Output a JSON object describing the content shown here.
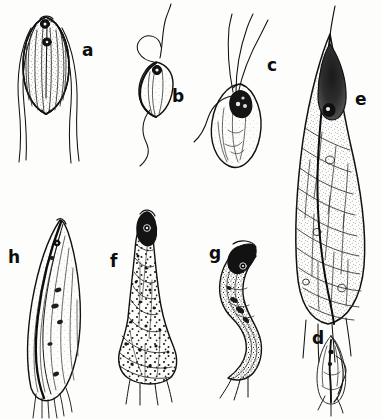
{
  "plate": {
    "width": 382,
    "height": 419,
    "background_color": "#fdfdfc",
    "ink_color": "#111111",
    "description": "Black-and-white scientific line drawing plate of eight flagellate protozoan cells labelled a through h"
  },
  "figure_labels": [
    {
      "id": "a",
      "text": "a",
      "x": 82,
      "y": 42,
      "size": 17
    },
    {
      "id": "b",
      "text": "b",
      "x": 172,
      "y": 88,
      "size": 17
    },
    {
      "id": "c",
      "text": "c",
      "x": 267,
      "y": 57,
      "size": 17
    },
    {
      "id": "e",
      "text": "e",
      "x": 355,
      "y": 91,
      "size": 17
    },
    {
      "id": "h",
      "text": "h",
      "x": 8,
      "y": 249,
      "size": 17
    },
    {
      "id": "f",
      "text": "f",
      "x": 110,
      "y": 253,
      "size": 17
    },
    {
      "id": "g",
      "text": "g",
      "x": 209,
      "y": 245,
      "size": 17
    },
    {
      "id": "d",
      "text": "d",
      "x": 312,
      "y": 330,
      "size": 17
    }
  ],
  "specimens": [
    {
      "id": "a",
      "name": "specimen-a",
      "shape": "broad teardrop / ovoid cell",
      "features": "longitudinal striations, stippled cytoplasm, two dark nuclei near anterior, four long trailing flagella",
      "bbox": [
        18,
        14,
        60,
        105
      ]
    },
    {
      "id": "b",
      "name": "specimen-b",
      "shape": "small heart / leaf shaped cell",
      "features": "single dark round nucleus at anterior, looping anterior flagellum, long undulating trailing flagellum",
      "bbox": [
        132,
        28,
        52,
        120
      ]
    },
    {
      "id": "c",
      "name": "specimen-c",
      "shape": "tilted bean / ovoid cell",
      "features": "dark lobed nucleus, three anterior flagella, one recurrent trailing flagellum, vacuolate cytoplasm",
      "bbox": [
        206,
        18,
        64,
        160
      ]
    },
    {
      "id": "d",
      "name": "specimen-d",
      "shape": "small narrow spindle cell",
      "features": "slender axial rod, faint envelope, short basal flagella; smallest specimen on plate",
      "bbox": [
        308,
        334,
        40,
        72
      ]
    },
    {
      "id": "e",
      "name": "specimen-e",
      "shape": "very large elongate cell with drawn-out pointed apex",
      "features": "dark elongate nucleus mass in apex, long apical flagellum, diagonal cross-hatched surface bands, heavy stippling, tuft of basal flagella",
      "bbox": [
        292,
        12,
        76,
        320
      ]
    },
    {
      "id": "f",
      "name": "specimen-f",
      "shape": "flask shaped cell with narrow neck and bulbous base",
      "features": "dark head with nucleus, spiral banding, coarse dot stippling, basal flagella",
      "bbox": [
        118,
        212,
        60,
        190
      ]
    },
    {
      "id": "g",
      "name": "specimen-g",
      "shape": "sinuous S-curved cell",
      "features": "dark hooked anterior head, stippled body, twisted posterior with trailing flagella",
      "bbox": [
        212,
        243,
        56,
        148
      ]
    },
    {
      "id": "h",
      "name": "specimen-h",
      "shape": "slender elongate curved cell",
      "features": "heavy dark axial line along length, fine longitudinal striations, small nucleus near apex, fine basal flagella",
      "bbox": [
        22,
        218,
        66,
        192
      ]
    }
  ]
}
